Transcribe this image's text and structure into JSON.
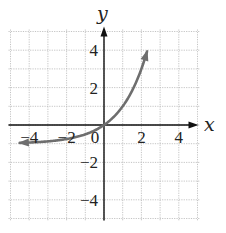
{
  "chart_data": {
    "type": "line",
    "title": "",
    "xlabel": "x",
    "ylabel": "y",
    "xlim": [
      -5,
      5
    ],
    "ylim": [
      -5,
      5
    ],
    "grid": true,
    "grid_step": 1,
    "x_ticks": [
      -4,
      -2,
      0,
      2,
      4
    ],
    "y_ticks": [
      -4,
      -2,
      2,
      4
    ],
    "x_tick_labels": [
      "−4",
      "−2",
      "0",
      "2",
      "4"
    ],
    "y_tick_labels": [
      "−4",
      "−2",
      "2",
      "4"
    ],
    "series": [
      {
        "name": "y = 2^x − 1",
        "color": "#6e6e6e",
        "x": [
          -4.5,
          -4,
          -3,
          -2,
          -1,
          0,
          0.5,
          1,
          1.5,
          2,
          2.3
        ],
        "y": [
          -0.96,
          -0.94,
          -0.88,
          -0.75,
          -0.5,
          0,
          0.41,
          1,
          1.83,
          3,
          3.9
        ],
        "arrows": "both"
      }
    ],
    "colors": {
      "grid": "#b5b5b5",
      "axes": "#111111",
      "curve": "#6e6e6e"
    }
  },
  "labels": {
    "x_axis": "x",
    "y_axis": "y"
  }
}
